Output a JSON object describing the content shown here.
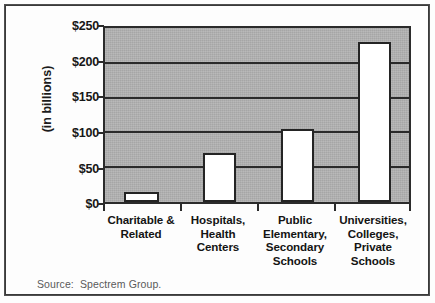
{
  "figure": {
    "source_note": "Source:  Spectrem Group."
  },
  "chart_data": {
    "type": "bar",
    "title": "",
    "subtitle": "",
    "xlabel": "",
    "ylabel": "(in billions)",
    "categories": [
      "Charitable &\nRelated",
      "Hospitals,\nHealth\nCenters",
      "Public\nElementary,\nSecondary\nSchools",
      "Universities,\nColleges,\nPrivate\nSchools"
    ],
    "category_lines": [
      [
        "Charitable &",
        "Related"
      ],
      [
        "Hospitals,",
        "Health",
        "Centers"
      ],
      [
        "Public",
        "Elementary,",
        "Secondary",
        "Schools"
      ],
      [
        "Universities,",
        "Colleges,",
        "Private",
        "Schools"
      ]
    ],
    "values": [
      15,
      70,
      105,
      230
    ],
    "ylim": [
      0,
      250
    ],
    "ytick_values": [
      0,
      50,
      100,
      150,
      200,
      250
    ],
    "ytick_labels": [
      "$0",
      "$50",
      "$100",
      "$150",
      "$200",
      "$250"
    ],
    "grid": true,
    "legend": null,
    "colors": {
      "bar_fill": "#ffffff",
      "bar_edge": "#242424",
      "plot_background": "#b2b2b2",
      "axis": "#2b2b2b",
      "text": "#141414",
      "source_text": "#5a5a5a",
      "frame": "#3a3a3a"
    }
  }
}
